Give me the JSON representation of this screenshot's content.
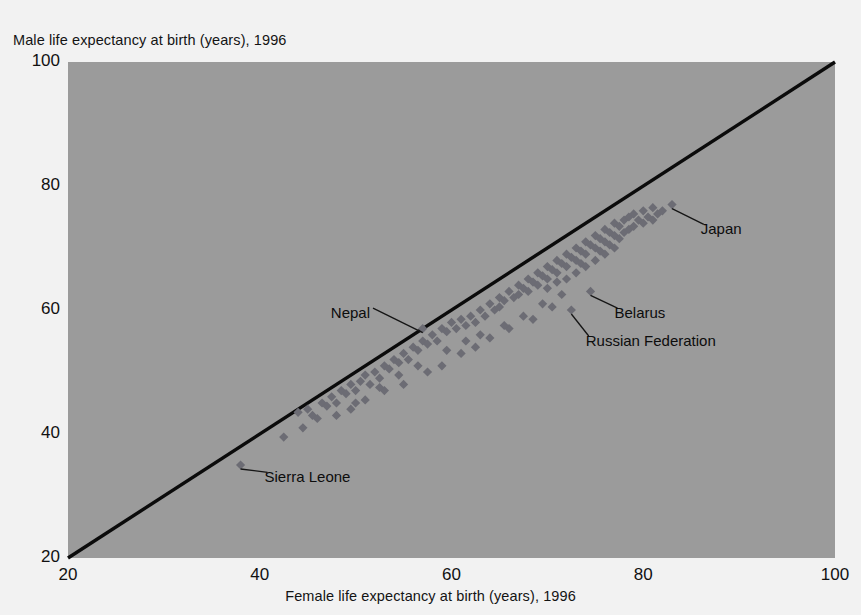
{
  "chart_data": {
    "type": "scatter",
    "title": "",
    "xlabel": "Female life expectancy at birth (years), 1996",
    "ylabel": "Male life expectancy at birth (years), 1996",
    "xlim": [
      20,
      100
    ],
    "ylim": [
      20,
      100
    ],
    "xticks": [
      20,
      40,
      60,
      80,
      100
    ],
    "yticks": [
      20,
      40,
      60,
      80,
      100
    ],
    "grid": false,
    "legend": "none",
    "plot_background_color": "#9b9b9b",
    "page_background_color": "#f2f2f2",
    "marker_color": "#6c6c74",
    "marker_shape": "diamond",
    "reference_line": {
      "description": "45-degree equality line y = x",
      "color": "#0b0b0b",
      "from": [
        20,
        20
      ],
      "to": [
        100,
        100
      ]
    },
    "annotations": [
      {
        "label": "Japan",
        "x": 83.0,
        "y": 77.0,
        "label_x": 86.0,
        "label_y": 73.0
      },
      {
        "label": "Belarus",
        "x": 74.5,
        "y": 63.0,
        "label_x": 77.0,
        "label_y": 59.5
      },
      {
        "label": "Russian Federation",
        "x": 72.5,
        "y": 60.0,
        "label_x": 74.0,
        "label_y": 55.0
      },
      {
        "label": "Nepal",
        "x": 57.0,
        "y": 57.0,
        "label_x": 51.5,
        "label_y": 59.5
      },
      {
        "label": "Sierra Leone",
        "x": 38.0,
        "y": 35.0,
        "label_x": 40.5,
        "label_y": 33.0
      }
    ],
    "points": [
      [
        38.0,
        35.0
      ],
      [
        42.5,
        39.5
      ],
      [
        44.0,
        43.5
      ],
      [
        45.0,
        44.0
      ],
      [
        45.5,
        43.0
      ],
      [
        46.5,
        45.0
      ],
      [
        47.0,
        44.5
      ],
      [
        47.5,
        46.0
      ],
      [
        48.0,
        45.0
      ],
      [
        48.5,
        47.0
      ],
      [
        49.0,
        46.5
      ],
      [
        49.5,
        48.0
      ],
      [
        50.0,
        47.0
      ],
      [
        50.5,
        48.5
      ],
      [
        51.0,
        49.5
      ],
      [
        51.5,
        48.0
      ],
      [
        52.0,
        50.0
      ],
      [
        52.5,
        49.0
      ],
      [
        53.0,
        51.0
      ],
      [
        53.5,
        50.5
      ],
      [
        54.0,
        52.0
      ],
      [
        54.5,
        51.5
      ],
      [
        55.0,
        53.0
      ],
      [
        55.5,
        52.0
      ],
      [
        56.0,
        54.0
      ],
      [
        56.5,
        53.5
      ],
      [
        57.0,
        57.0
      ],
      [
        57.0,
        55.0
      ],
      [
        57.5,
        54.5
      ],
      [
        58.0,
        56.0
      ],
      [
        58.5,
        55.0
      ],
      [
        59.0,
        57.0
      ],
      [
        59.5,
        56.5
      ],
      [
        60.0,
        58.0
      ],
      [
        60.5,
        57.0
      ],
      [
        61.0,
        58.5
      ],
      [
        61.5,
        57.5
      ],
      [
        62.0,
        59.0
      ],
      [
        62.5,
        58.0
      ],
      [
        63.0,
        60.0
      ],
      [
        63.5,
        59.0
      ],
      [
        64.0,
        61.0
      ],
      [
        64.5,
        60.0
      ],
      [
        65.0,
        62.0
      ],
      [
        65.0,
        60.5
      ],
      [
        65.5,
        61.5
      ],
      [
        66.0,
        63.0
      ],
      [
        66.5,
        62.0
      ],
      [
        67.0,
        64.0
      ],
      [
        67.0,
        62.5
      ],
      [
        67.5,
        63.5
      ],
      [
        68.0,
        65.0
      ],
      [
        68.0,
        63.0
      ],
      [
        68.5,
        64.5
      ],
      [
        69.0,
        66.0
      ],
      [
        69.0,
        64.0
      ],
      [
        69.5,
        65.5
      ],
      [
        70.0,
        67.0
      ],
      [
        70.0,
        65.0
      ],
      [
        70.0,
        63.5
      ],
      [
        70.5,
        66.5
      ],
      [
        71.0,
        68.0
      ],
      [
        71.0,
        66.0
      ],
      [
        71.0,
        64.5
      ],
      [
        71.5,
        67.5
      ],
      [
        72.0,
        69.0
      ],
      [
        72.0,
        67.0
      ],
      [
        72.0,
        65.0
      ],
      [
        72.5,
        68.5
      ],
      [
        72.5,
        60.0
      ],
      [
        73.0,
        70.0
      ],
      [
        73.0,
        68.0
      ],
      [
        73.0,
        66.0
      ],
      [
        73.5,
        69.5
      ],
      [
        73.5,
        67.5
      ],
      [
        74.0,
        71.0
      ],
      [
        74.0,
        69.0
      ],
      [
        74.0,
        67.0
      ],
      [
        74.5,
        70.5
      ],
      [
        74.5,
        63.0
      ],
      [
        75.0,
        72.0
      ],
      [
        75.0,
        70.0
      ],
      [
        75.0,
        68.0
      ],
      [
        75.5,
        71.5
      ],
      [
        75.5,
        69.5
      ],
      [
        76.0,
        73.0
      ],
      [
        76.0,
        71.0
      ],
      [
        76.0,
        69.0
      ],
      [
        76.5,
        72.5
      ],
      [
        76.5,
        70.5
      ],
      [
        77.0,
        74.0
      ],
      [
        77.0,
        72.0
      ],
      [
        77.0,
        70.0
      ],
      [
        77.5,
        73.5
      ],
      [
        77.5,
        71.5
      ],
      [
        78.0,
        74.5
      ],
      [
        78.0,
        72.5
      ],
      [
        78.5,
        75.0
      ],
      [
        78.5,
        73.0
      ],
      [
        79.0,
        75.5
      ],
      [
        79.0,
        73.5
      ],
      [
        79.5,
        74.5
      ],
      [
        80.0,
        76.0
      ],
      [
        80.0,
        74.0
      ],
      [
        80.5,
        75.0
      ],
      [
        81.0,
        76.5
      ],
      [
        81.0,
        74.5
      ],
      [
        81.5,
        75.5
      ],
      [
        82.0,
        76.0
      ],
      [
        83.0,
        77.0
      ],
      [
        44.5,
        41.0
      ],
      [
        46.0,
        42.5
      ],
      [
        48.0,
        43.0
      ],
      [
        50.0,
        45.0
      ],
      [
        51.0,
        45.5
      ],
      [
        53.0,
        47.0
      ],
      [
        55.0,
        48.0
      ],
      [
        57.5,
        50.0
      ],
      [
        59.0,
        51.0
      ],
      [
        61.0,
        53.0
      ],
      [
        62.5,
        54.0
      ],
      [
        64.0,
        55.5
      ],
      [
        66.0,
        57.0
      ],
      [
        68.5,
        58.5
      ],
      [
        70.5,
        60.5
      ],
      [
        63.0,
        56.0
      ],
      [
        65.5,
        57.5
      ],
      [
        67.5,
        59.0
      ],
      [
        69.5,
        61.0
      ],
      [
        71.5,
        62.5
      ],
      [
        59.5,
        53.5
      ],
      [
        61.5,
        55.0
      ],
      [
        56.5,
        51.0
      ],
      [
        54.5,
        49.5
      ],
      [
        52.5,
        47.5
      ],
      [
        49.5,
        44.0
      ]
    ]
  }
}
